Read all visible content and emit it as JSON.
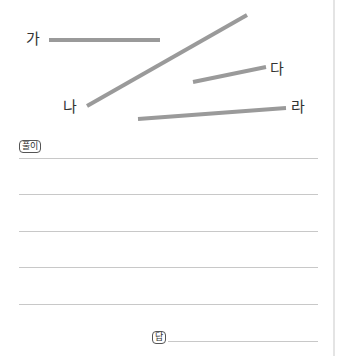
{
  "figure": {
    "line_color": "#9a9a9a",
    "segments": [
      {
        "label": "가",
        "x1": 49,
        "y1": 40,
        "x2": 160,
        "y2": 40
      },
      {
        "label": "나",
        "x1": 87,
        "y1": 106,
        "x2": 247,
        "y2": 15
      },
      {
        "label": "다",
        "x1": 193,
        "y1": 82,
        "x2": 266,
        "y2": 67
      },
      {
        "label": "라",
        "x1": 138,
        "y1": 119,
        "x2": 286,
        "y2": 108
      }
    ]
  },
  "solution": {
    "label": "풀이"
  },
  "answer": {
    "label": "답"
  }
}
